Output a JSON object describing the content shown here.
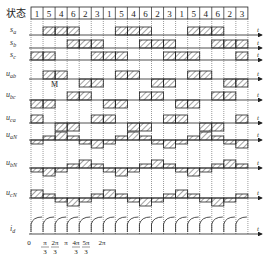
{
  "diagram": {
    "header_label": "状态",
    "states": [
      "1",
      "5",
      "4",
      "6",
      "2",
      "3",
      "1",
      "5",
      "4",
      "6",
      "2",
      "3",
      "1",
      "5",
      "4",
      "6",
      "2",
      "3"
    ],
    "marker_label": "M",
    "axis_time_label": "t",
    "rows": [
      {
        "id": "sa",
        "label": "s",
        "sub": "a"
      },
      {
        "id": "sb",
        "label": "s",
        "sub": "b"
      },
      {
        "id": "sc",
        "label": "s",
        "sub": "c"
      },
      {
        "id": "uab",
        "label": "u",
        "sub": "ab"
      },
      {
        "id": "ubc",
        "label": "u",
        "sub": "bc"
      },
      {
        "id": "uca",
        "label": "u",
        "sub": "ca"
      },
      {
        "id": "uaN",
        "label": "u",
        "sub": "aN"
      },
      {
        "id": "ubN",
        "label": "u",
        "sub": "bN"
      },
      {
        "id": "ucN",
        "label": "u",
        "sub": "cN"
      },
      {
        "id": "id",
        "label": "i",
        "sub": "d"
      }
    ],
    "x_ticks": [
      {
        "num": "0",
        "den": ""
      },
      {
        "num": "π",
        "den": "3"
      },
      {
        "num": "2π",
        "den": "3"
      },
      {
        "num": "π",
        "den": ""
      },
      {
        "num": "4π",
        "den": "3"
      },
      {
        "num": "5π",
        "den": "3"
      },
      {
        "num": "2π",
        "den": ""
      }
    ],
    "switch_on": {
      "sa": [
        "5",
        "4",
        "6"
      ],
      "sb": [
        "6",
        "2",
        "3"
      ],
      "sc": [
        "3",
        "1",
        "5"
      ]
    }
  }
}
